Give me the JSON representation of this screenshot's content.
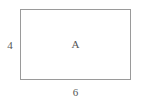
{
  "figure": {
    "type": "rectangle-diagram",
    "background_color": "#ffffff",
    "stroke_color": "#9a9a9a",
    "text_color": "#555555",
    "shape": {
      "name": "rectangle",
      "interior_label": "A",
      "height_label": "4",
      "width_label": "6"
    }
  },
  "chart_data": {
    "type": "table",
    "title": "",
    "categories": [
      "width",
      "height",
      "region"
    ],
    "values": [
      6,
      4,
      "A"
    ]
  }
}
